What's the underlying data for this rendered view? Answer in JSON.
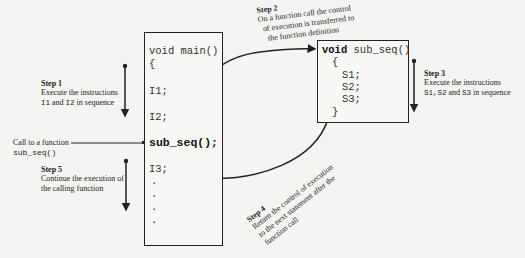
{
  "main_function": {
    "header": "void main()",
    "open_brace": "{",
    "lines": [
      "I1;",
      "I2;"
    ],
    "call": "sub_seq();",
    "after_call": "I3;",
    "ellipsis": [
      ".",
      ".",
      ".",
      "."
    ]
  },
  "sub_function": {
    "keyword": "void",
    "name": "sub_seq()",
    "open_brace": "{",
    "lines": [
      "S1;",
      "S2;",
      "S3;"
    ],
    "close_brace": "}"
  },
  "steps": {
    "step1": {
      "title": "Step 1",
      "line1": "Execute the instructions",
      "code1": "I1",
      "mid": " and ",
      "code2": "I2",
      "tail": " in sequence"
    },
    "step2": {
      "title": "Step 2",
      "line1": "On a function call the control",
      "line2": "of execution is transferred to",
      "line3": "the function definition"
    },
    "step3": {
      "title": "Step 3",
      "line1": "Execute the instructions",
      "codes": "S1,S2",
      "mid": " and ",
      "code3": "S3",
      "tail": "  in sequence"
    },
    "step4": {
      "title": "Step 4",
      "line1": "Return the control of execution",
      "line2": "to the next statement after the",
      "line3": "function call"
    },
    "step5": {
      "title": "Step 5",
      "line1": "Continue the execution of",
      "line2": "the calling function"
    }
  },
  "call_label": {
    "line1": "Call to a function",
    "code": "sub_seq()"
  }
}
